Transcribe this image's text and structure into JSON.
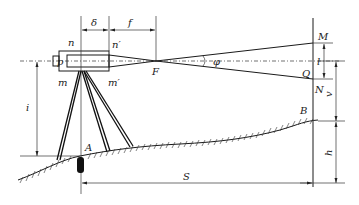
{
  "diagram": {
    "labels": {
      "delta": "δ",
      "f": "f",
      "n": "n",
      "n_prime": "n′",
      "p": "p",
      "F": "F",
      "m": "m",
      "m_prime": "m′",
      "phi": "φ",
      "M": "M",
      "Q": "Q",
      "l": "l",
      "N": "N",
      "v": "v",
      "i": "i",
      "A": "A",
      "B": "B",
      "h": "h",
      "S": "S"
    },
    "colors": {
      "line": "#1a1a1a",
      "background": "#ffffff"
    }
  }
}
